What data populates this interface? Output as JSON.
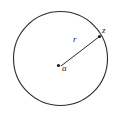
{
  "figure": {
    "background_color": "#ffffff",
    "stroke_color": "#2b2b2b",
    "label_color": "#1a1a1a",
    "circle": {
      "name": "circle-outline",
      "center_x": 60.5,
      "center_y": 58.5,
      "radius": 47,
      "stroke_width": 1.1,
      "fill": "none"
    },
    "radius_segment": {
      "name": "radius-line",
      "x1": 61,
      "y1": 66,
      "x2": 99.5,
      "y2": 36.5,
      "stroke_width": 1
    },
    "center_point": {
      "name": "center-point-marker",
      "cx": 58.5,
      "cy": 65.5,
      "r": 1.6
    },
    "boundary_point": {
      "name": "boundary-point-marker",
      "cx": 99.5,
      "cy": 36.5,
      "r": 1.6
    },
    "labels": {
      "radius": "r",
      "boundary_point": "z",
      "center": "a"
    }
  }
}
